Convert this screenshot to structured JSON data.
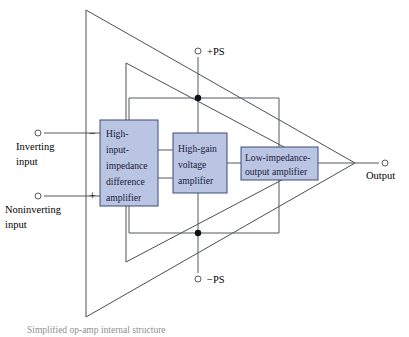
{
  "figure": {
    "caption": "Simplified op-amp internal structure"
  },
  "colors": {
    "block_fill": "#b9c5e2",
    "block_stroke": "#3d4a7a",
    "block_text": "#1b1b3a",
    "wire": "#555a60",
    "triangle": "#4a4f55",
    "junction_dot": "#111111",
    "background": "#ffffff"
  },
  "blocks": [
    {
      "id": "difference-amplifier",
      "lines": [
        "High-",
        "input-",
        "impedance",
        "difference",
        "amplifier"
      ],
      "x": 100,
      "y": 120,
      "width": 58,
      "height": 86
    },
    {
      "id": "voltage-amplifier",
      "lines": [
        "High-gain",
        "voltage",
        "amplifier"
      ],
      "x": 173,
      "y": 133,
      "width": 54,
      "height": 60
    },
    {
      "id": "output-amplifier",
      "lines": [
        "Low-impedance-",
        "output amplifier"
      ],
      "x": 241,
      "y": 147,
      "width": 77,
      "height": 33
    }
  ],
  "terminals": [
    {
      "id": "inverting-input",
      "label_lines": [
        "Inverting",
        "input"
      ],
      "sign": "−",
      "cx": 38,
      "cy": 133,
      "label_x": 16,
      "label_y": 150,
      "sign_x": 89,
      "sign_y": 137
    },
    {
      "id": "noninverting-input",
      "label_lines": [
        "Noninverting",
        "input"
      ],
      "sign": "+",
      "cx": 38,
      "cy": 196,
      "label_x": 5,
      "label_y": 213,
      "sign_x": 89,
      "sign_y": 200
    },
    {
      "id": "output",
      "label_lines": [
        "Output"
      ],
      "sign": "",
      "cx": 385,
      "cy": 163,
      "label_x": 366,
      "label_y": 179,
      "sign_x": 0,
      "sign_y": 0
    },
    {
      "id": "positive-supply",
      "label_lines": [
        "+PS"
      ],
      "sign": "",
      "cx": 198,
      "cy": 51,
      "label_x": 207,
      "label_y": 55,
      "sign_x": 0,
      "sign_y": 0
    },
    {
      "id": "negative-supply",
      "label_lines": [
        "−PS"
      ],
      "sign": "",
      "cx": 198,
      "cy": 279,
      "label_x": 207,
      "label_y": 283,
      "sign_x": 0,
      "sign_y": 0
    }
  ],
  "junctions": [
    {
      "id": "positive-rail-junction",
      "cx": 198,
      "cy": 98
    },
    {
      "id": "negative-rail-junction",
      "cx": 198,
      "cy": 233
    }
  ],
  "triangles": {
    "outer": {
      "id": "outer-triangle",
      "points": "86,10 355,163 86,317"
    },
    "inner": {
      "id": "inner-triangle",
      "points": "126,63 314,163 126,262"
    }
  }
}
